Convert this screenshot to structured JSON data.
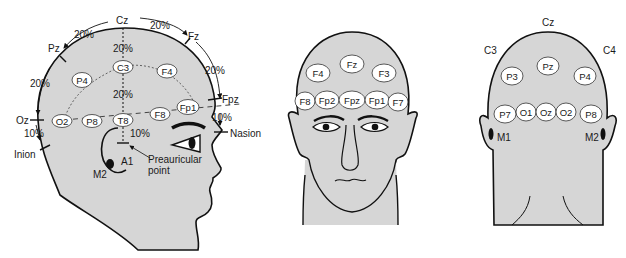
{
  "colors": {
    "head_fill": "#d6d6d6",
    "outline": "#111111",
    "electrode_fill": "#ffffff",
    "background": "#ffffff"
  },
  "side_view": {
    "landmarks": {
      "cz": "Cz",
      "pz": "Pz",
      "fz": "Fz",
      "fpz": "Fpz",
      "oz": "Oz",
      "inion": "Inion",
      "nasion": "Nasion",
      "a1": "A1",
      "m2": "M2",
      "preauricular_1": "Preauricular",
      "preauricular_2": "point"
    },
    "percents": {
      "cz_fz": "20%",
      "pz_cz": "20%",
      "oz_pz": "20%",
      "fz_fpz": "20%",
      "fpz_nasion": "10%",
      "inion_oz": "10%",
      "cz_c3": "20%",
      "c3_t8": "20%",
      "t8_pre": "10%"
    },
    "electrodes": {
      "c3": "C3",
      "f4": "F4",
      "p4": "P4",
      "fp1": "Fp1",
      "f8": "F8",
      "o2": "O2",
      "p8": "P8",
      "t8": "T8"
    }
  },
  "front_view": {
    "electrodes": {
      "fz": "Fz",
      "f4": "F4",
      "f3": "F3",
      "f8": "F8",
      "fp2": "Fp2",
      "fpz": "Fpz",
      "fp1": "Fp1",
      "f7": "F7"
    }
  },
  "back_view": {
    "labels": {
      "cz": "Cz",
      "c3": "C3",
      "c4": "C4",
      "m1": "M1",
      "m2": "M2"
    },
    "electrodes": {
      "pz": "Pz",
      "p3": "P3",
      "p4": "P4",
      "p7": "P7",
      "o1": "O1",
      "oz": "Oz",
      "o2": "O2",
      "p8": "P8"
    }
  }
}
